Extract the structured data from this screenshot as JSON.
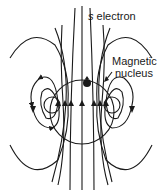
{
  "diagram": {
    "labels": {
      "electron_prefix": "s",
      "electron_word": "electron",
      "nucleus_line1": "Magnetic",
      "nucleus_line2": "nucleus"
    },
    "colors": {
      "line": "#1a1a1a",
      "background": "#ffffff"
    }
  }
}
